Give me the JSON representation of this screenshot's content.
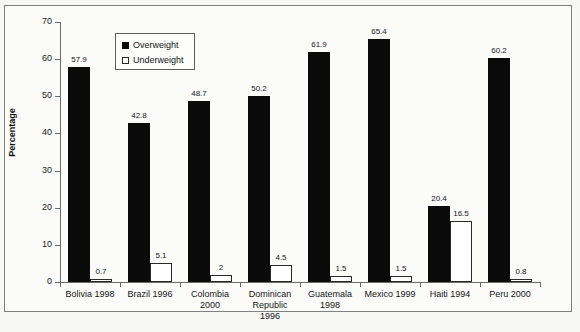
{
  "chart_data": {
    "type": "bar",
    "title": "",
    "subtitle": "",
    "xlabel": "",
    "ylabel": "Percentage",
    "ylim": [
      0,
      70
    ],
    "ytick_step": 10,
    "yticks": [
      0,
      10,
      20,
      30,
      40,
      50,
      60,
      70
    ],
    "grid": false,
    "legend_position": "top-left-inside",
    "categories": [
      "Bolivia 1998",
      "Brazil 1996",
      "Colombia 2000",
      "Dominican Republic 1996",
      "Guatemala 1998",
      "Mexico 1999",
      "Haiti 1994",
      "Peru 2000"
    ],
    "category_lines": [
      [
        "Bolivia 1998"
      ],
      [
        "Brazil 1996"
      ],
      [
        "Colombia",
        "2000"
      ],
      [
        "Dominican",
        "Republic",
        "1996"
      ],
      [
        "Guatemala",
        "1998"
      ],
      [
        "Mexico 1999"
      ],
      [
        "Haiti 1994"
      ],
      [
        "Peru 2000"
      ]
    ],
    "series": [
      {
        "name": "Overweight",
        "color": "#0a0a0a",
        "style": "filled",
        "values": [
          57.9,
          42.8,
          48.7,
          50.2,
          61.9,
          65.4,
          20.4,
          60.2
        ],
        "labels": [
          "57.9",
          "42.8",
          "48.7",
          "50.2",
          "61.9",
          "65.4",
          "20.4",
          "60.2"
        ]
      },
      {
        "name": "Underweight",
        "color": "#ffffff",
        "style": "hollow",
        "values": [
          0.7,
          5.1,
          2,
          4.5,
          1.5,
          1.5,
          16.5,
          0.8
        ],
        "labels": [
          "0.7",
          "5.1",
          "2",
          "4.5",
          "1.5",
          "1.5",
          "16.5",
          "0.8"
        ]
      }
    ]
  },
  "legend": {
    "entries": [
      {
        "label": "Overweight",
        "swatch": "filled-square-icon"
      },
      {
        "label": "Underweight",
        "swatch": "hollow-square-icon"
      }
    ]
  },
  "axis": {
    "y_title": "Percentage",
    "y_tick_labels": [
      "70",
      "60",
      "50",
      "40",
      "30",
      "20",
      "10",
      "0"
    ]
  }
}
